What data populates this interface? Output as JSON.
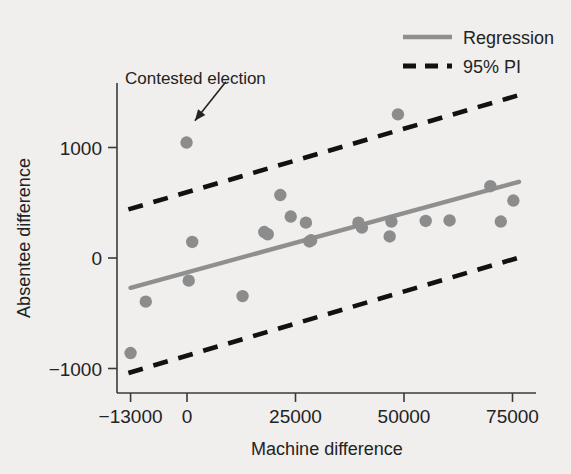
{
  "chart_data": {
    "type": "scatter",
    "title": "",
    "xlabel": "Machine difference",
    "ylabel": "Absentee difference",
    "xlim": [
      -16500,
      78000
    ],
    "ylim": [
      -1230,
      1420
    ],
    "xticks": [
      -13000,
      0,
      25000,
      50000,
      75000
    ],
    "xticklabels": [
      "−13000",
      "0",
      "25000",
      "50000",
      "75000"
    ],
    "yticks": [
      1000,
      0,
      -1000
    ],
    "yticklabels": [
      "1000",
      "0",
      "−1000"
    ],
    "grid": false,
    "legend_position": "top-right",
    "marker_color": "#8c8c8c",
    "regression_color": "#8f8f8f",
    "pi_color": "#111111",
    "points": [
      {
        "x": -13000,
        "y": -860
      },
      {
        "x": -9500,
        "y": -395
      },
      {
        "x": -100,
        "y": 1045
      },
      {
        "x": 1200,
        "y": 145
      },
      {
        "x": 400,
        "y": -205
      },
      {
        "x": 12800,
        "y": -345
      },
      {
        "x": 17800,
        "y": 235
      },
      {
        "x": 18600,
        "y": 215
      },
      {
        "x": 21500,
        "y": 570
      },
      {
        "x": 23900,
        "y": 375
      },
      {
        "x": 27400,
        "y": 320
      },
      {
        "x": 28200,
        "y": 150
      },
      {
        "x": 28600,
        "y": 160
      },
      {
        "x": 39500,
        "y": 320
      },
      {
        "x": 40300,
        "y": 275
      },
      {
        "x": 46700,
        "y": 195
      },
      {
        "x": 47100,
        "y": 330
      },
      {
        "x": 48600,
        "y": 1300
      },
      {
        "x": 55000,
        "y": 335
      },
      {
        "x": 60500,
        "y": 340
      },
      {
        "x": 69900,
        "y": 650
      },
      {
        "x": 72300,
        "y": 330
      },
      {
        "x": 75200,
        "y": 520
      }
    ],
    "regression_line": {
      "name": "Regression",
      "x_start": -13000,
      "y_start": -270,
      "x_end": 76500,
      "y_end": 690
    },
    "prediction_interval": {
      "name": "95% PI",
      "level": "95%",
      "upper": {
        "x_start": -13500,
        "y_start": 440,
        "x_end": 77000,
        "y_end": 1480
      },
      "lower": {
        "x_start": -13500,
        "y_start": -1040,
        "x_end": 77000,
        "y_end": 10
      }
    },
    "annotations": [
      {
        "text": "Contested election",
        "text_x": 1000,
        "text_y": 1680,
        "target_x": 200,
        "target_y": 1160
      }
    ],
    "legend": [
      {
        "label": "Regression",
        "style": "solid",
        "color": "#8f8f8f"
      },
      {
        "label": "95% PI",
        "style": "dashed",
        "color": "#111111"
      }
    ]
  }
}
